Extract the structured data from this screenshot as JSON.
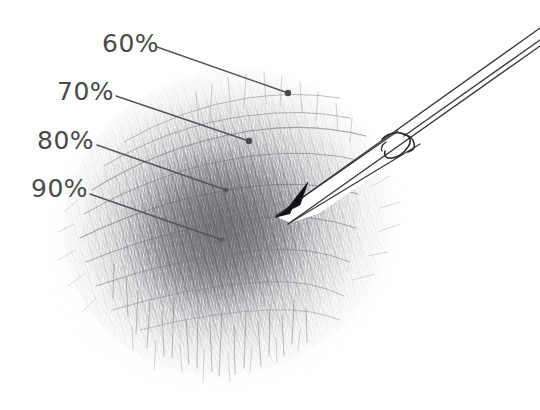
{
  "figure": {
    "background_color": "#ffffff",
    "label_color": "#4a4a4a",
    "leader_line_color": "#55555a",
    "graphite_color": "#6e6e72",
    "pencil_outline_color": "#3a3a40",
    "pencil_lead_color": "#111115"
  },
  "callouts": [
    {
      "id": "callout-60",
      "label": "60%",
      "label_x": 102,
      "label_y": 31,
      "leader_start_x": 157,
      "leader_start_y": 47,
      "leader_end_x": 288,
      "leader_end_y": 93,
      "dot_x": 288,
      "dot_y": 93,
      "dot_radius": 3.2
    },
    {
      "id": "callout-70",
      "label": "70%",
      "label_x": 57,
      "label_y": 79,
      "leader_start_x": 116,
      "leader_start_y": 96,
      "leader_end_x": 249,
      "leader_end_y": 141,
      "dot_x": 249,
      "dot_y": 141,
      "dot_radius": 3.2
    },
    {
      "id": "callout-80",
      "label": "80%",
      "label_x": 37,
      "label_y": 128,
      "leader_start_x": 97,
      "leader_start_y": 145,
      "leader_end_x": 226,
      "leader_end_y": 190,
      "dot_x": 226,
      "dot_y": 190,
      "dot_radius": 2.6
    },
    {
      "id": "callout-90",
      "label": "90%",
      "label_x": 31,
      "label_y": 176,
      "leader_start_x": 90,
      "leader_start_y": 194,
      "leader_end_x": 222,
      "leader_end_y": 240,
      "dot_x": 222,
      "dot_y": 240,
      "dot_radius": 2.4
    }
  ],
  "graphite_blob": {
    "name": "pencil-scribble-blob",
    "center_x": 230,
    "center_y": 225,
    "radius_x": 165,
    "radius_y": 150,
    "rotation_deg": -18,
    "darkest_center_x": 222,
    "darkest_center_y": 228,
    "description": "Dense cross-hatched graphite scribble, darkest at centre, fading to wispy strokes at the edges"
  },
  "pencil": {
    "name": "pencil-tip",
    "tip_x": 276,
    "tip_y": 216,
    "angle_deg": -34,
    "description": "Line-drawn sharpened pencil entering from the upper right, black graphite lead at the tip, three barrel lines running off the right edge, plus a small sharpening-notch squiggle"
  }
}
